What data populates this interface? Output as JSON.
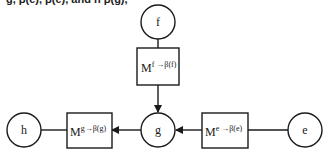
{
  "caption_fragment": "g, β(e), β(e), and h β(g),",
  "nodes": {
    "f": {
      "label": "f"
    },
    "g": {
      "label": "g"
    },
    "h": {
      "label": "h"
    },
    "e": {
      "label": "e"
    }
  },
  "messages": {
    "f_to_g": {
      "base": "M",
      "sup": "f →β(f)"
    },
    "g_to_h": {
      "base": "M",
      "sup": "g→β(g)"
    },
    "e_to_g": {
      "base": "M",
      "sup": "e →β(e)"
    }
  },
  "colors": {
    "stroke": "#1a1a1a",
    "background": "#ffffff"
  }
}
